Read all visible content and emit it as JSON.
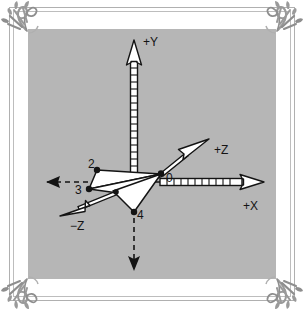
{
  "figure": {
    "background_color": "#b6b6b6",
    "page_color": "#ffffff",
    "frame_color": "#b0b0b0",
    "ink_color": "#141414"
  },
  "axes": [
    {
      "name": "positive-y-axis",
      "label": "+Y",
      "style": "ladder-outline-arrow",
      "direction": "up"
    },
    {
      "name": "positive-x-axis",
      "label": "+X",
      "style": "ladder-outline-arrow",
      "direction": "right"
    },
    {
      "name": "positive-z-axis",
      "label": "+Z",
      "style": "outline-arrow",
      "direction": "up-right"
    },
    {
      "name": "negative-z-axis",
      "label": "−Z",
      "style": "outline-arrow",
      "direction": "down-left"
    },
    {
      "name": "negative-x-axis",
      "label": "",
      "style": "dashed-solid-arrow",
      "direction": "left"
    },
    {
      "name": "negative-y-axis",
      "label": "",
      "style": "dashed-solid-arrow",
      "direction": "down"
    }
  ],
  "vertices": [
    {
      "name": "vertex-0",
      "label": "0"
    },
    {
      "name": "vertex-2",
      "label": "2"
    },
    {
      "name": "vertex-3",
      "label": "3"
    },
    {
      "name": "vertex-4",
      "label": "4"
    }
  ],
  "polygon": {
    "name": "dart-polygon",
    "fill": "#ffffff",
    "stroke": "#141414"
  },
  "corner_ornaments": [
    {
      "name": "corner-ornament-top-left"
    },
    {
      "name": "corner-ornament-top-right"
    },
    {
      "name": "corner-ornament-bottom-left"
    },
    {
      "name": "corner-ornament-bottom-right"
    }
  ]
}
